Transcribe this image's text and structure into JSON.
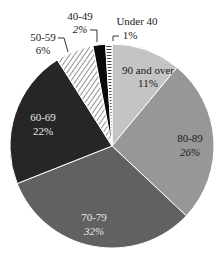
{
  "chart_data": {
    "type": "pie",
    "title": "",
    "start_angle": "12 o'clock",
    "direction": "clockwise",
    "categories": [
      "90 and over",
      "80-89",
      "70-79",
      "60-69",
      "50-59",
      "40-49",
      "Under 40"
    ],
    "values": [
      11,
      26,
      32,
      22,
      6,
      2,
      1
    ],
    "value_labels": [
      "11%",
      "26%",
      "32%",
      "22%",
      "6%",
      "2%",
      "1%"
    ],
    "unit": "%",
    "slice_styles": [
      {
        "fill": "#c4c4c4",
        "pattern": "solid"
      },
      {
        "fill": "#979797",
        "pattern": "solid"
      },
      {
        "fill": "#616161",
        "pattern": "solid"
      },
      {
        "fill": "#262626",
        "pattern": "solid"
      },
      {
        "fill": "#ffffff",
        "pattern": "diagonal-hatch"
      },
      {
        "fill": "#0a0a0a",
        "pattern": "solid"
      },
      {
        "fill": "#ffffff",
        "pattern": "horizontal-lines"
      }
    ],
    "legend": "none (labels placed on/near slices)"
  },
  "labels": {
    "s0": {
      "name": "90 and over",
      "pct": "11%"
    },
    "s1": {
      "name": "80-89",
      "pct": "26%"
    },
    "s2": {
      "name": "70-79",
      "pct": "32%"
    },
    "s3": {
      "name": "60-69",
      "pct": "22%"
    },
    "s4": {
      "name": "50-59",
      "pct": "6%"
    },
    "s5": {
      "name": "40-49",
      "pct": "2%"
    },
    "s6": {
      "name": "Under 40",
      "pct": "1%"
    }
  }
}
